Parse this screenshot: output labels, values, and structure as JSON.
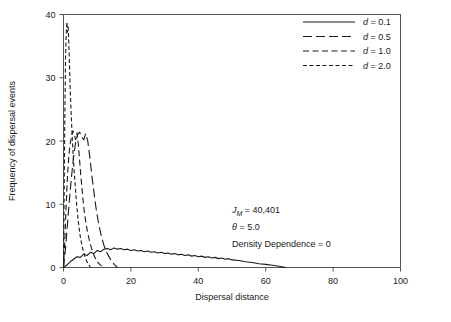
{
  "chart_data": {
    "type": "line",
    "title": "",
    "xlabel": "Dispersal distance",
    "ylabel": "Frequency of dispersal events",
    "xlim": [
      0,
      100
    ],
    "ylim": [
      0,
      40
    ],
    "xticks": [
      0,
      20,
      40,
      60,
      80,
      100
    ],
    "yticks": [
      0,
      10,
      20,
      30,
      40
    ],
    "xtick_labels": [
      "0",
      "20",
      "40",
      "60",
      "80",
      "100"
    ],
    "ytick_labels": [
      "0",
      "10",
      "20",
      "30",
      "40"
    ],
    "grid": false,
    "frame": "box",
    "legend_position": "top-right",
    "series": [
      {
        "name": "d = 0.1",
        "label_symbol": "d",
        "label_value": "0.1",
        "dash": "solid",
        "color": "#1a1a1a",
        "x": [
          0,
          1,
          2,
          3,
          4,
          5,
          6,
          7,
          8,
          9,
          10,
          11,
          12,
          13,
          14,
          15,
          16,
          17,
          18,
          19,
          20,
          21,
          22,
          23,
          24,
          25,
          26,
          27,
          28,
          29,
          30,
          31,
          32,
          33,
          34,
          35,
          36,
          37,
          38,
          39,
          40,
          41,
          42,
          43,
          44,
          45,
          46,
          47,
          48,
          49,
          50,
          52,
          54,
          56,
          58,
          60,
          62,
          64,
          66
        ],
        "y": [
          0.0,
          0.4,
          0.9,
          1.3,
          1.7,
          1.6,
          2.1,
          1.9,
          2.4,
          2.2,
          2.7,
          2.5,
          2.9,
          3.0,
          2.8,
          3.1,
          2.9,
          3.0,
          2.8,
          2.9,
          2.7,
          2.8,
          2.6,
          2.7,
          2.5,
          2.6,
          2.4,
          2.5,
          2.3,
          2.4,
          2.2,
          2.3,
          2.1,
          2.2,
          2.0,
          2.1,
          1.9,
          2.0,
          1.8,
          1.9,
          1.7,
          1.8,
          1.6,
          1.7,
          1.5,
          1.6,
          1.4,
          1.5,
          1.3,
          1.4,
          1.2,
          1.1,
          0.9,
          0.8,
          0.6,
          0.5,
          0.35,
          0.2,
          0.0
        ]
      },
      {
        "name": "d = 0.5",
        "label_symbol": "d",
        "label_value": "0.5",
        "dash": "long-dash",
        "color": "#1a1a1a",
        "x": [
          0,
          0.6,
          1.2,
          1.8,
          2.4,
          3.0,
          3.6,
          4.2,
          4.8,
          5.4,
          6.0,
          6.6,
          7.2,
          7.8,
          8.4,
          9.0,
          9.6,
          10.2,
          10.8,
          11.4,
          12.0,
          12.8,
          13.6,
          14.4,
          15.2,
          16.0
        ],
        "y": [
          0.0,
          3.0,
          7.0,
          11.0,
          14.5,
          17.5,
          19.8,
          21.0,
          21.4,
          20.6,
          20.2,
          21.2,
          20.0,
          17.5,
          14.6,
          12.0,
          9.6,
          7.6,
          6.0,
          4.6,
          3.5,
          2.4,
          1.6,
          0.9,
          0.4,
          0.0
        ]
      },
      {
        "name": "d = 1.0",
        "label_symbol": "d",
        "label_value": "1.0",
        "dash": "medium-dash",
        "color": "#1a1a1a",
        "x": [
          0,
          0.4,
          0.8,
          1.2,
          1.6,
          2.0,
          2.4,
          2.8,
          3.2,
          3.6,
          4.0,
          4.4,
          4.8,
          5.2,
          5.6,
          6.0,
          6.6,
          7.2,
          7.8,
          8.4,
          9.0,
          9.6,
          10.2,
          10.8,
          11.4,
          12.0
        ],
        "y": [
          0.0,
          4.5,
          10.0,
          14.6,
          17.8,
          19.6,
          20.8,
          21.6,
          21.0,
          20.2,
          21.3,
          19.4,
          16.8,
          14.2,
          11.8,
          9.6,
          7.2,
          5.4,
          4.0,
          2.9,
          2.0,
          1.3,
          0.8,
          0.45,
          0.2,
          0.0
        ]
      },
      {
        "name": "d = 2.0",
        "label_symbol": "d",
        "label_value": "2.0",
        "dash": "short-dash",
        "color": "#1a1a1a",
        "x": [
          0,
          0.2,
          0.4,
          0.6,
          0.8,
          1.0,
          1.2,
          1.4,
          1.6,
          1.8,
          2.0,
          2.3,
          2.6,
          2.9,
          3.2,
          3.6,
          4.0,
          4.5,
          5.0,
          5.6,
          6.2,
          6.8,
          7.4,
          8.0
        ],
        "y": [
          0.0,
          12.0,
          24.0,
          33.0,
          37.0,
          38.8,
          37.2,
          38.0,
          35.0,
          31.5,
          28.0,
          24.0,
          20.5,
          17.5,
          15.0,
          12.0,
          9.4,
          6.8,
          4.8,
          3.2,
          2.0,
          1.1,
          0.5,
          0.0
        ]
      }
    ],
    "annotations": [
      {
        "id": "jm",
        "symbol": "J",
        "subscript": "M",
        "text": " = 40,401"
      },
      {
        "id": "theta",
        "symbol": "θ",
        "subscript": "",
        "text": " = 5.0"
      },
      {
        "id": "density",
        "symbol": "",
        "subscript": "",
        "text": "Density Dependence = 0"
      }
    ]
  }
}
